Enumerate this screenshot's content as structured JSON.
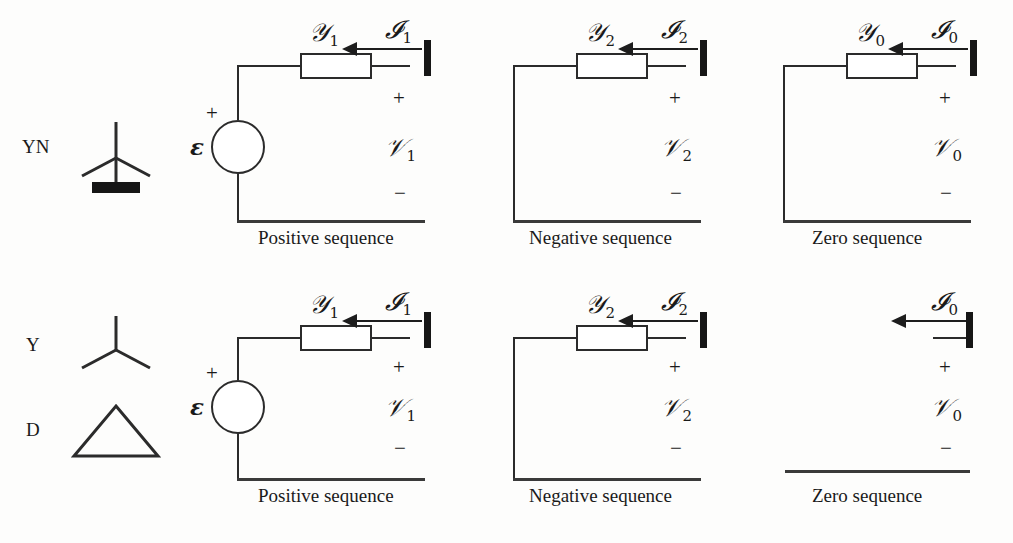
{
  "figure": {
    "rows": [
      {
        "id": "row-yn",
        "connection_labels": [
          {
            "name": "YN",
            "symbol": "wye-grounded"
          }
        ],
        "networks": [
          {
            "id": "yn-positive",
            "caption": "Positive sequence",
            "admittance": {
              "base": "𝒴",
              "subscript": "1"
            },
            "current": {
              "base": "𝓘",
              "subscript": "1"
            },
            "voltage": {
              "base": "𝒱",
              "subscript": "1"
            },
            "source": "ε",
            "source_plus": "+",
            "plus": "+",
            "minus": "−",
            "has_source": true,
            "has_admittance": true,
            "closed_loop": true
          },
          {
            "id": "yn-negative",
            "caption": "Negative sequence",
            "admittance": {
              "base": "𝒴",
              "subscript": "2"
            },
            "current": {
              "base": "𝓘",
              "subscript": "2"
            },
            "voltage": {
              "base": "𝒱",
              "subscript": "2"
            },
            "plus": "+",
            "minus": "−",
            "has_source": false,
            "has_admittance": true,
            "closed_loop": true
          },
          {
            "id": "yn-zero",
            "caption": "Zero sequence",
            "admittance": {
              "base": "𝒴",
              "subscript": "0"
            },
            "current": {
              "base": "𝓘",
              "subscript": "0"
            },
            "voltage": {
              "base": "𝒱",
              "subscript": "0"
            },
            "plus": "+",
            "minus": "−",
            "has_source": false,
            "has_admittance": true,
            "closed_loop": true
          }
        ]
      },
      {
        "id": "row-yd",
        "connection_labels": [
          {
            "name": "Y",
            "symbol": "wye"
          },
          {
            "name": "D",
            "symbol": "delta"
          }
        ],
        "networks": [
          {
            "id": "yd-positive",
            "caption": "Positive sequence",
            "admittance": {
              "base": "𝒴",
              "subscript": "1"
            },
            "current": {
              "base": "𝓘",
              "subscript": "1"
            },
            "voltage": {
              "base": "𝒱",
              "subscript": "1"
            },
            "source": "ε",
            "source_plus": "+",
            "plus": "+",
            "minus": "−",
            "has_source": true,
            "has_admittance": true,
            "closed_loop": true
          },
          {
            "id": "yd-negative",
            "caption": "Negative sequence",
            "admittance": {
              "base": "𝒴",
              "subscript": "2"
            },
            "current": {
              "base": "𝓘",
              "subscript": "2"
            },
            "voltage": {
              "base": "𝒱",
              "subscript": "2"
            },
            "plus": "+",
            "minus": "−",
            "has_source": false,
            "has_admittance": true,
            "closed_loop": true
          },
          {
            "id": "yd-zero",
            "caption": "Zero sequence",
            "current": {
              "base": "𝓘",
              "subscript": "0"
            },
            "voltage": {
              "base": "𝒱",
              "subscript": "0"
            },
            "plus": "+",
            "minus": "−",
            "has_source": false,
            "has_admittance": false,
            "closed_loop": false
          }
        ]
      }
    ],
    "colors": {
      "ink": "#2b2b2b",
      "terminal": "#161616",
      "background": "#fdfdfc"
    }
  }
}
